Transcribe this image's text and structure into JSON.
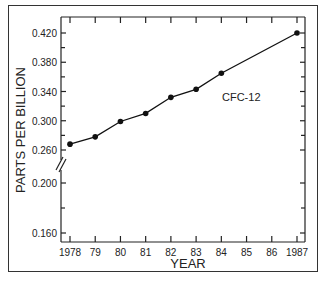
{
  "chart_data": {
    "type": "line",
    "title": "",
    "xlabel": "YEAR",
    "ylabel": "PARTS PER BILLION",
    "x_tick_labels": [
      "1978",
      "79",
      "80",
      "81",
      "82",
      "83",
      "84",
      "85",
      "86",
      "1987"
    ],
    "y_tick_labels": [
      "0.160",
      "0.200",
      "0.260",
      "0.300",
      "0.340",
      "0.380",
      "0.420"
    ],
    "y_axis_break": "between 0.200 and 0.260",
    "grid": false,
    "series": [
      {
        "name": "CFC-12",
        "x": [
          1978,
          1979,
          1980,
          1981,
          1982,
          1983,
          1984,
          1987
        ],
        "values": [
          0.268,
          0.278,
          0.299,
          0.31,
          0.332,
          0.343,
          0.365,
          0.42
        ]
      }
    ],
    "annotations": [
      {
        "text": "CFC-12",
        "near_x": 1984,
        "near_y": 0.343
      }
    ]
  }
}
